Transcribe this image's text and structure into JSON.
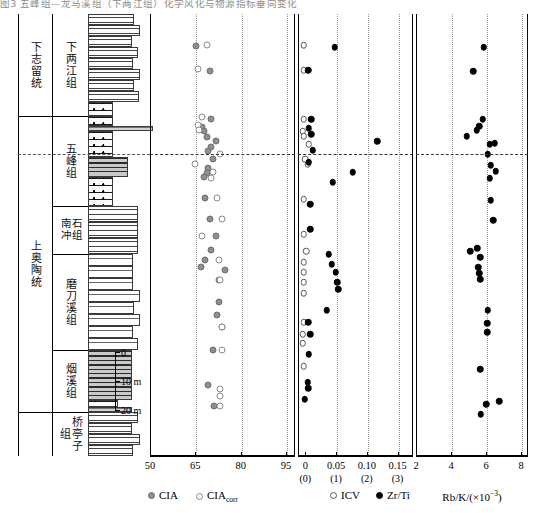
{
  "caption": "图3 五峰组—龙马溪组（下两江组）化学风化与物源指标垂向变化",
  "stratigraphy": {
    "system_column_header": "",
    "systems": [
      {
        "label": "下志留统",
        "top": 14,
        "height": 102
      },
      {
        "label": "上奥陶统",
        "top": 116,
        "height": 340
      }
    ],
    "formations": [
      {
        "label": "下两江组",
        "top": 14,
        "height": 102
      },
      {
        "label": "五峰组",
        "top": 116,
        "height": 90
      },
      {
        "label": "南石\n冲组",
        "top": 206,
        "height": 48,
        "two_col": true,
        "col_a": "南冲",
        "col_b": "石组"
      },
      {
        "label": "磨刀溪组",
        "top": 254,
        "height": 96
      },
      {
        "label": "烟溪组",
        "top": 350,
        "height": 62
      },
      {
        "label": "桥亭子组",
        "top": 412,
        "height": 44
      }
    ],
    "scalebar": {
      "ticks": [
        {
          "label": "0",
          "offset": 0
        },
        {
          "label": "10 m",
          "offset": 29
        },
        {
          "label": "20 m",
          "offset": 58
        }
      ]
    }
  },
  "panels": [
    {
      "name": "cia-panel",
      "axis": {
        "ticks": [
          {
            "value": 50,
            "label": "50"
          },
          {
            "value": 65,
            "label": "65"
          },
          {
            "value": 80,
            "label": "80"
          },
          {
            "value": 95,
            "label": "95"
          }
        ],
        "min": 50,
        "max": 98
      },
      "gridlines": [
        65,
        80,
        95
      ],
      "series": [
        {
          "name": "CIA",
          "style": "filled-gray"
        },
        {
          "name": "CIA_corr",
          "style": "open-gray"
        }
      ]
    },
    {
      "name": "icv-zrti-panel",
      "axis": {
        "ticks": [
          {
            "value": 0,
            "label": "0",
            "sub": "(0)"
          },
          {
            "value": 0.05,
            "label": "0.05",
            "sub": "(1)"
          },
          {
            "value": 0.1,
            "label": "0.10",
            "sub": "(2)"
          },
          {
            "value": 0.15,
            "label": "0.15",
            "sub": "(3)"
          }
        ],
        "min": -0.012,
        "max": 0.175
      },
      "gridlines": [
        0.05,
        0.1,
        0.15
      ],
      "series": [
        {
          "name": "ICV",
          "style": "open-black"
        },
        {
          "name": "Zr/Ti",
          "style": "filled-black"
        }
      ]
    },
    {
      "name": "rbk-panel",
      "axis": {
        "ticks": [
          {
            "value": 2,
            "label": "2"
          },
          {
            "value": 4,
            "label": "4"
          },
          {
            "value": 6,
            "label": "6"
          },
          {
            "value": 8,
            "label": "8"
          }
        ],
        "min": 2,
        "max": 8.4
      },
      "gridlines": [
        4,
        6,
        8
      ],
      "series": [
        {
          "name": "Rb/K",
          "style": "filled-black"
        }
      ]
    }
  ],
  "legend": [
    {
      "label": "CIA",
      "sub": "",
      "style": "filled-gray",
      "panel": 0
    },
    {
      "label": "CIA",
      "sub": "corr",
      "style": "open-gray",
      "panel": 0
    },
    {
      "label": "ICV",
      "sub": "",
      "style": "open-black",
      "panel": 1
    },
    {
      "label": "Zr/Ti",
      "sub": "",
      "style": "filled-black",
      "panel": 1
    }
  ],
  "axis_titles": [
    {
      "text": "Rb/K/(×10",
      "sup": "−3",
      "tail": ")",
      "panel": 2
    }
  ],
  "chart_data": {
    "type": "scatter",
    "ylabel": "Stratigraphic depth (m)",
    "grid": true,
    "legend_position": "bottom",
    "correlation_line_depth_px": 140,
    "panels": [
      {
        "name": "CIA",
        "xlabel": "CIA",
        "xlim": [
          50,
          98
        ],
        "xticks": [
          50,
          65,
          80,
          95
        ],
        "series": [
          {
            "name": "CIA",
            "marker": "filled-gray",
            "points": [
              {
                "x": 65.0,
                "depth": 32
              },
              {
                "x": 69.5,
                "depth": 57
              },
              {
                "x": 70.0,
                "depth": 105
              },
              {
                "x": 67.0,
                "depth": 113
              },
              {
                "x": 67.5,
                "depth": 117
              },
              {
                "x": 68.5,
                "depth": 123
              },
              {
                "x": 71.5,
                "depth": 127
              },
              {
                "x": 70.0,
                "depth": 133
              },
              {
                "x": 69.0,
                "depth": 137
              },
              {
                "x": 70.5,
                "depth": 145
              },
              {
                "x": 69.0,
                "depth": 154
              },
              {
                "x": 68.5,
                "depth": 159
              },
              {
                "x": 67.5,
                "depth": 163
              },
              {
                "x": 68.0,
                "depth": 184
              },
              {
                "x": 69.5,
                "depth": 205
              },
              {
                "x": 71.5,
                "depth": 222
              },
              {
                "x": 70.0,
                "depth": 236
              },
              {
                "x": 68.0,
                "depth": 246
              },
              {
                "x": 66.5,
                "depth": 253
              },
              {
                "x": 74.5,
                "depth": 256
              },
              {
                "x": 72.5,
                "depth": 266
              },
              {
                "x": 72.5,
                "depth": 288
              },
              {
                "x": 72.0,
                "depth": 301
              },
              {
                "x": 73.5,
                "depth": 313
              },
              {
                "x": 70.5,
                "depth": 336
              },
              {
                "x": 69.0,
                "depth": 371
              },
              {
                "x": 71.0,
                "depth": 392
              }
            ]
          },
          {
            "name": "CIA_corr",
            "marker": "open-gray",
            "points": [
              {
                "x": 68.5,
                "depth": 31
              },
              {
                "x": 65.5,
                "depth": 55
              },
              {
                "x": 67.0,
                "depth": 103
              },
              {
                "x": 65.5,
                "depth": 111
              },
              {
                "x": 66.0,
                "depth": 116
              },
              {
                "x": 73.0,
                "depth": 140
              },
              {
                "x": 64.5,
                "depth": 150
              },
              {
                "x": 70.5,
                "depth": 158
              },
              {
                "x": 70.0,
                "depth": 164
              },
              {
                "x": 72.0,
                "depth": 184
              },
              {
                "x": 73.5,
                "depth": 205
              },
              {
                "x": 67.0,
                "depth": 222
              },
              {
                "x": 72.5,
                "depth": 246
              },
              {
                "x": 73.0,
                "depth": 266
              },
              {
                "x": 73.5,
                "depth": 313
              },
              {
                "x": 73.5,
                "depth": 336
              },
              {
                "x": 73.0,
                "depth": 375
              },
              {
                "x": 73.0,
                "depth": 382
              },
              {
                "x": 73.0,
                "depth": 392
              }
            ]
          }
        ]
      },
      {
        "name": "ICV_ZrTi",
        "xlabel": "ICV / Zr/Ti",
        "xlim": [
          -0.012,
          0.175
        ],
        "xticks": [
          0,
          0.05,
          0.1,
          0.15
        ],
        "series": [
          {
            "name": "ICV",
            "marker": "open-black",
            "points": [
              {
                "x": -0.004,
                "depth": 31
              },
              {
                "x": -0.004,
                "depth": 56
              },
              {
                "x": -0.004,
                "depth": 105
              },
              {
                "x": -0.006,
                "depth": 117
              },
              {
                "x": -0.004,
                "depth": 122
              },
              {
                "x": 0.004,
                "depth": 130
              },
              {
                "x": -0.002,
                "depth": 145
              },
              {
                "x": 0.002,
                "depth": 150
              },
              {
                "x": -0.004,
                "depth": 185
              },
              {
                "x": -0.004,
                "depth": 220
              },
              {
                "x": 0.0,
                "depth": 237
              },
              {
                "x": -0.004,
                "depth": 248
              },
              {
                "x": -0.004,
                "depth": 258
              },
              {
                "x": -0.004,
                "depth": 268
              },
              {
                "x": -0.004,
                "depth": 279
              },
              {
                "x": -0.004,
                "depth": 308
              },
              {
                "x": -0.006,
                "depth": 320
              },
              {
                "x": -0.006,
                "depth": 329
              },
              {
                "x": -0.004,
                "depth": 352
              }
            ]
          },
          {
            "name": "Zr/Ti",
            "marker": "filled-black",
            "points": [
              {
                "x": 0.046,
                "depth": 33
              },
              {
                "x": 0.003,
                "depth": 56
              },
              {
                "x": 0.008,
                "depth": 105
              },
              {
                "x": 0.004,
                "depth": 114
              },
              {
                "x": 0.008,
                "depth": 120
              },
              {
                "x": 0.115,
                "depth": 127
              },
              {
                "x": 0.01,
                "depth": 136
              },
              {
                "x": 0.004,
                "depth": 148
              },
              {
                "x": 0.075,
                "depth": 158
              },
              {
                "x": 0.043,
                "depth": 168
              },
              {
                "x": 0.006,
                "depth": 190
              },
              {
                "x": 0.006,
                "depth": 215
              },
              {
                "x": 0.036,
                "depth": 240
              },
              {
                "x": 0.041,
                "depth": 250
              },
              {
                "x": 0.048,
                "depth": 258
              },
              {
                "x": 0.05,
                "depth": 268
              },
              {
                "x": 0.052,
                "depth": 275
              },
              {
                "x": 0.033,
                "depth": 296
              },
              {
                "x": 0.003,
                "depth": 308
              },
              {
                "x": 0.006,
                "depth": 320
              },
              {
                "x": 0.004,
                "depth": 340
              },
              {
                "x": 0.002,
                "depth": 368
              },
              {
                "x": 0.003,
                "depth": 374
              },
              {
                "x": -0.003,
                "depth": 385
              }
            ]
          }
        ]
      },
      {
        "name": "RbK",
        "xlabel": "Rb/K/(×10−3)",
        "xlim": [
          2,
          8.4
        ],
        "xticks": [
          2,
          4,
          6,
          8
        ],
        "series": [
          {
            "name": "Rb/K",
            "marker": "filled-black",
            "points": [
              {
                "x": 5.8,
                "depth": 33
              },
              {
                "x": 5.2,
                "depth": 57
              },
              {
                "x": 5.75,
                "depth": 105
              },
              {
                "x": 5.55,
                "depth": 112
              },
              {
                "x": 5.4,
                "depth": 116
              },
              {
                "x": 4.85,
                "depth": 122
              },
              {
                "x": 6.15,
                "depth": 130
              },
              {
                "x": 6.45,
                "depth": 129
              },
              {
                "x": 6.05,
                "depth": 140
              },
              {
                "x": 6.2,
                "depth": 151
              },
              {
                "x": 6.5,
                "depth": 157
              },
              {
                "x": 6.15,
                "depth": 164
              },
              {
                "x": 6.2,
                "depth": 186
              },
              {
                "x": 6.35,
                "depth": 206
              },
              {
                "x": 5.05,
                "depth": 237
              },
              {
                "x": 5.45,
                "depth": 234
              },
              {
                "x": 5.6,
                "depth": 243
              },
              {
                "x": 5.5,
                "depth": 253
              },
              {
                "x": 5.55,
                "depth": 259
              },
              {
                "x": 5.6,
                "depth": 265
              },
              {
                "x": 6.05,
                "depth": 296
              },
              {
                "x": 6.0,
                "depth": 309
              },
              {
                "x": 6.0,
                "depth": 318
              },
              {
                "x": 5.6,
                "depth": 355
              },
              {
                "x": 5.95,
                "depth": 390
              },
              {
                "x": 6.7,
                "depth": 387
              },
              {
                "x": 5.65,
                "depth": 400
              }
            ]
          }
        ]
      }
    ]
  }
}
